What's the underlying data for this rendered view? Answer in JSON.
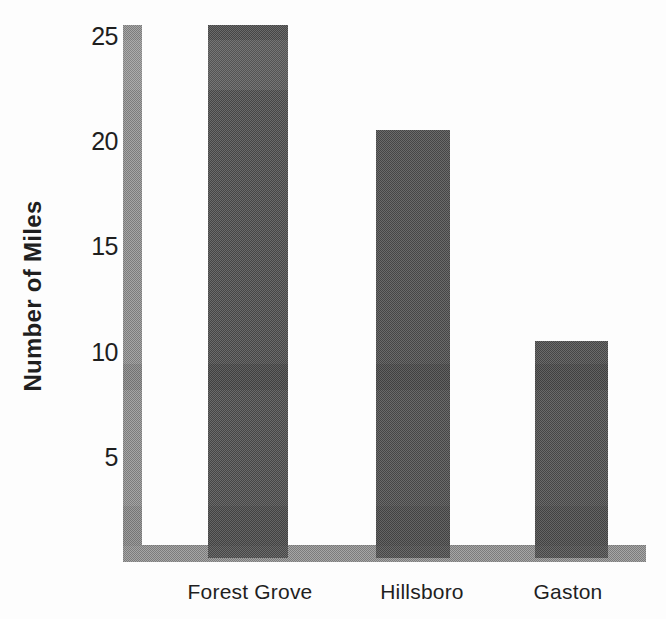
{
  "chart_data": {
    "type": "bar",
    "title": "",
    "categories": [
      "Forest Grove",
      "Hillsboro",
      "Gaston"
    ],
    "values": [
      25.5,
      20.5,
      10.5
    ],
    "ylabel": "Number of Miles",
    "xlabel": "",
    "yticks": [
      5,
      10,
      15,
      20,
      25
    ],
    "ylim": [
      0,
      26
    ],
    "grid": false,
    "legend": "none"
  },
  "colors": {
    "background": "#fdfdfd",
    "text": "#1f1f1f",
    "bar": "#595959",
    "axis_band": "#919191"
  }
}
